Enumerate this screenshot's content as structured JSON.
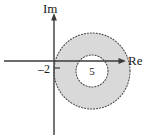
{
  "figure": {
    "background_color": "#ffffff",
    "axis_color": "#3a3a3a",
    "shade_color": "#d9d9d9",
    "dotted_color": "#4a4a4a",
    "text_color": "#1a1a1a"
  },
  "axes": {
    "imaginary_label": "Im",
    "real_label": "Re",
    "origin_x": 54,
    "origin_y": 61
  },
  "ticks": [
    {
      "label": "–2",
      "axis": "real",
      "value": -2,
      "x": 40,
      "y": 74
    }
  ],
  "annotations": [
    {
      "label": "5",
      "x": 92,
      "y": 73
    }
  ],
  "chart_data": {
    "type": "scatter",
    "xlabel": "Re",
    "ylabel": "Im",
    "grid": false,
    "legend": "none",
    "regions": [
      {
        "name": "annulus",
        "shape": "annulus",
        "fill": "#d9d9d9",
        "boundary_style": "dotted",
        "center_px": [
          92,
          71
        ],
        "outer_radius_px": 38,
        "inner_radius_px": 16
      }
    ],
    "tick_labels": [
      "–2"
    ],
    "annotations": [
      "5"
    ]
  }
}
